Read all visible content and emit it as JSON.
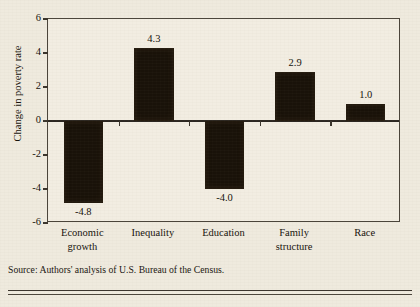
{
  "figure": {
    "background_color": "#efeade",
    "bar_color": "#191209",
    "axis_color": "#3a342c"
  },
  "source_note": "Source: Authors' analysis of U.S. Bureau of the Census.",
  "chart_data": {
    "type": "bar",
    "title": "",
    "xlabel": "",
    "ylabel": "Change in poverty rate",
    "categories": [
      "Economic growth",
      "Inequality",
      "Education",
      "Family structure",
      "Race"
    ],
    "category_lines": [
      [
        "Economic",
        "growth"
      ],
      [
        "Inequality",
        ""
      ],
      [
        "Education",
        ""
      ],
      [
        "Family",
        "structure"
      ],
      [
        "Race",
        ""
      ]
    ],
    "values": [
      -4.8,
      4.3,
      -4.0,
      2.9,
      1.0
    ],
    "value_labels": [
      "-4.8",
      "4.3",
      "-4.0",
      "2.9",
      "1.0"
    ],
    "ylim": [
      -6,
      6
    ],
    "yticks": [
      6,
      4,
      2,
      0,
      -2,
      -4,
      -6
    ],
    "ytick_labels": [
      "6",
      "4",
      "2",
      "0",
      "-2",
      "-4",
      "-6"
    ],
    "grid": false,
    "legend": "none",
    "zero_line": 0
  }
}
